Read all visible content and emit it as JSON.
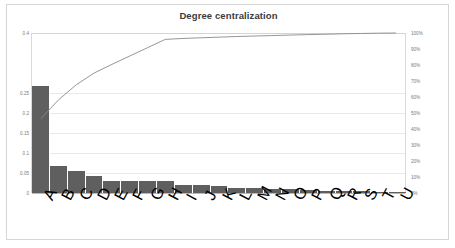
{
  "chart_data": {
    "type": "bar",
    "title": "Degree centralization",
    "xlabel": "",
    "ylabel": "",
    "grid": true,
    "legend": "none",
    "ylim": [
      0,
      0.4
    ],
    "y2lim": [
      0,
      1
    ],
    "yticks": [
      "0",
      "0.05",
      "0.1",
      "0.15",
      "0.2",
      "0.25",
      "0.4"
    ],
    "ytick_values": [
      0,
      0.05,
      0.1,
      0.15,
      0.2,
      0.25,
      0.4
    ],
    "y2ticks": [
      "0%",
      "10%",
      "20%",
      "30%",
      "40%",
      "50%",
      "60%",
      "70%",
      "80%",
      "90%",
      "100%"
    ],
    "y2tick_values": [
      0,
      0.1,
      0.2,
      0.3,
      0.4,
      0.5,
      0.6,
      0.7,
      0.8,
      0.9,
      1.0
    ],
    "categories": [
      "A",
      "B",
      "C",
      "D",
      "E",
      "F",
      "G",
      "H",
      "I",
      "J",
      "K",
      "L",
      "M",
      "N",
      "O",
      "P",
      "Q",
      "R",
      "S",
      "T",
      "U"
    ],
    "values": [
      0.268,
      0.068,
      0.054,
      0.042,
      0.031,
      0.03,
      0.03,
      0.03,
      0.021,
      0.02,
      0.017,
      0.013,
      0.012,
      0.01,
      0.009,
      0.008,
      0.006,
      0.005,
      0.004,
      0.003,
      0.002
    ],
    "series": [
      {
        "name": "Degree centralization",
        "type": "bar",
        "axis": "left",
        "color": "#5f5f5f",
        "values": [
          0.268,
          0.068,
          0.054,
          0.042,
          0.031,
          0.03,
          0.03,
          0.03,
          0.021,
          0.02,
          0.017,
          0.013,
          0.012,
          0.01,
          0.009,
          0.008,
          0.006,
          0.005,
          0.004,
          0.003,
          0.002
        ]
      },
      {
        "name": "Cumulative %",
        "type": "line",
        "axis": "right",
        "color": "#8a8a8a",
        "values": [
          0.465,
          0.583,
          0.677,
          0.75,
          0.804,
          0.856,
          0.908,
          0.96,
          0.966,
          0.97,
          0.974,
          0.978,
          0.981,
          0.984,
          0.987,
          0.99,
          0.992,
          0.995,
          0.997,
          0.999,
          1.0
        ]
      }
    ]
  },
  "axis": {
    "left_ticks": [
      "0.4",
      "0.25",
      "0.2",
      "0.15",
      "0.1",
      "0.05",
      "0"
    ],
    "right_ticks": [
      "100%",
      "90%",
      "80%",
      "70%",
      "60%",
      "50%",
      "40%",
      "30%",
      "20%",
      "10%",
      "0%"
    ]
  }
}
